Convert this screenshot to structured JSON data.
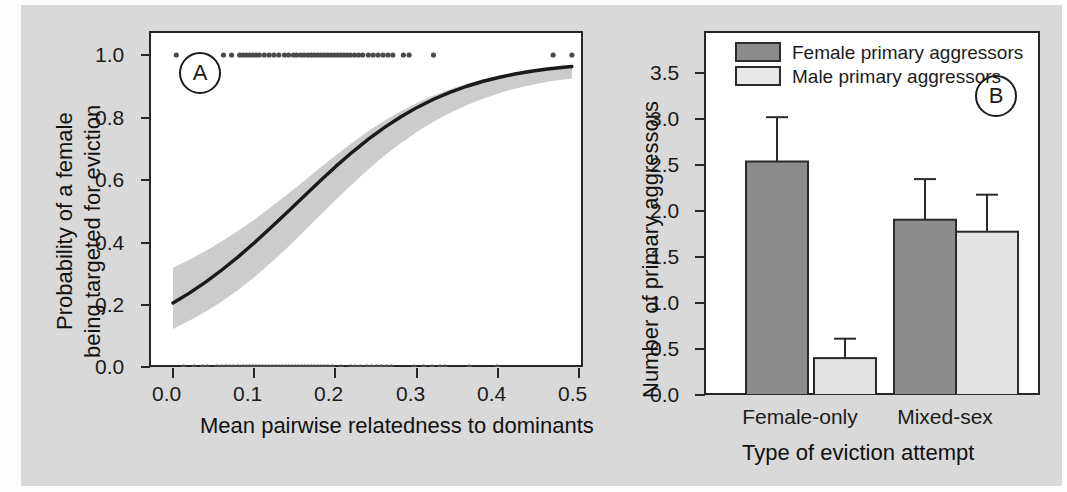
{
  "figure": {
    "background_color": "#d9d9d9",
    "panel_background": "#ffffff",
    "ink_color": "#262626"
  },
  "panels": [
    {
      "tag": "A",
      "chart_index": 0
    },
    {
      "tag": "B",
      "chart_index": 1
    }
  ],
  "chart_data": [
    {
      "type": "line",
      "panel": "A",
      "title": "",
      "xlabel": "Mean pairwise relatedness to dominants",
      "ylabel": "Probability of a female\nbeing targeted for eviction",
      "ylabel_line1": "Probability of a female",
      "ylabel_line2": "being targeted for eviction",
      "xlim": [
        -0.015,
        0.515
      ],
      "ylim": [
        -0.06,
        1.06
      ],
      "xticks": [
        0.0,
        0.1,
        0.2,
        0.3,
        0.4,
        0.5
      ],
      "xtick_labels": [
        "0.0",
        "0.1",
        "0.2",
        "0.3",
        "0.4",
        "0.5"
      ],
      "yticks": [
        0.0,
        0.2,
        0.4,
        0.6,
        0.8,
        1.0
      ],
      "ytick_labels": [
        "0.0",
        "0.2",
        "0.4",
        "0.6",
        "0.8",
        "1.0"
      ],
      "grid": false,
      "legend": null,
      "series": [
        {
          "name": "fitted logistic curve",
          "style": "solid-line",
          "color": "#1a1a1a",
          "linewidth": 3,
          "x": [
            0.0,
            0.02,
            0.04,
            0.06,
            0.08,
            0.1,
            0.12,
            0.14,
            0.16,
            0.18,
            0.2,
            0.22,
            0.24,
            0.26,
            0.28,
            0.3,
            0.32,
            0.34,
            0.36,
            0.38,
            0.4,
            0.42,
            0.44,
            0.46,
            0.48,
            0.49
          ],
          "y": [
            0.205,
            0.237,
            0.272,
            0.311,
            0.353,
            0.398,
            0.446,
            0.495,
            0.545,
            0.595,
            0.643,
            0.688,
            0.73,
            0.768,
            0.802,
            0.832,
            0.858,
            0.88,
            0.899,
            0.915,
            0.928,
            0.939,
            0.948,
            0.955,
            0.961,
            0.963
          ]
        },
        {
          "name": "95% confidence band",
          "style": "ribbon",
          "color": "#c9c9c9",
          "x": [
            0.0,
            0.02,
            0.04,
            0.06,
            0.08,
            0.1,
            0.12,
            0.14,
            0.16,
            0.18,
            0.2,
            0.22,
            0.24,
            0.26,
            0.28,
            0.3,
            0.32,
            0.34,
            0.36,
            0.38,
            0.4,
            0.42,
            0.44,
            0.46,
            0.48,
            0.49
          ],
          "y_upper": [
            0.318,
            0.344,
            0.372,
            0.403,
            0.437,
            0.473,
            0.512,
            0.553,
            0.594,
            0.637,
            0.679,
            0.719,
            0.756,
            0.79,
            0.82,
            0.847,
            0.87,
            0.89,
            0.907,
            0.921,
            0.933,
            0.943,
            0.951,
            0.958,
            0.963,
            0.966
          ],
          "y_lower": [
            0.122,
            0.148,
            0.177,
            0.21,
            0.247,
            0.288,
            0.333,
            0.381,
            0.432,
            0.484,
            0.536,
            0.586,
            0.634,
            0.678,
            0.718,
            0.754,
            0.786,
            0.814,
            0.838,
            0.859,
            0.877,
            0.892,
            0.904,
            0.914,
            0.921,
            0.924
          ]
        },
        {
          "name": "observations: targeted (y = 1)",
          "style": "points",
          "marker": "filled-circle",
          "y_value": 1.0,
          "x": [
            0.004,
            0.062,
            0.072,
            0.082,
            0.086,
            0.09,
            0.094,
            0.098,
            0.102,
            0.106,
            0.112,
            0.118,
            0.124,
            0.13,
            0.137,
            0.142,
            0.148,
            0.152,
            0.157,
            0.161,
            0.166,
            0.17,
            0.174,
            0.178,
            0.182,
            0.186,
            0.19,
            0.194,
            0.198,
            0.202,
            0.206,
            0.21,
            0.214,
            0.218,
            0.223,
            0.228,
            0.233,
            0.24,
            0.246,
            0.252,
            0.258,
            0.264,
            0.27,
            0.283,
            0.29,
            0.32,
            0.467,
            0.49
          ]
        },
        {
          "name": "observations: not targeted (y = 0)",
          "style": "points",
          "marker": "filled-circle",
          "y_value": 0.0,
          "x": [
            0.013,
            0.026,
            0.036,
            0.042,
            0.054,
            0.06,
            0.065,
            0.069,
            0.074,
            0.08,
            0.086,
            0.09,
            0.094,
            0.098,
            0.102,
            0.106,
            0.11,
            0.114,
            0.118,
            0.122,
            0.126,
            0.13,
            0.134,
            0.138,
            0.142,
            0.146,
            0.15,
            0.154,
            0.158,
            0.162,
            0.166,
            0.17,
            0.174,
            0.178,
            0.182,
            0.186,
            0.19,
            0.196,
            0.206,
            0.218,
            0.224,
            0.23,
            0.238,
            0.244,
            0.25,
            0.256,
            0.262,
            0.268,
            0.296,
            0.308,
            0.318,
            0.328,
            0.334,
            0.364,
            0.398
          ]
        }
      ]
    },
    {
      "type": "bar",
      "panel": "B",
      "title": "",
      "xlabel": "Type of eviction attempt",
      "ylabel": "Number of primary aggressors",
      "categories": [
        "Female-only",
        "Mixed-sex"
      ],
      "ylim": [
        0.0,
        3.75
      ],
      "yticks": [
        0.0,
        0.5,
        1.0,
        1.5,
        2.0,
        2.5,
        3.0,
        3.5
      ],
      "ytick_labels": [
        "0.0",
        "0.5",
        "1.0",
        "1.5",
        "2.0",
        "2.5",
        "3.0",
        "3.5"
      ],
      "grid": false,
      "legend_position": "top-left",
      "series": [
        {
          "name": "Female primary aggressors",
          "color": "#8c8c8c",
          "edge_color": "#2b2b2b",
          "values": [
            2.53,
            1.9
          ],
          "error_upper": [
            3.01,
            2.34
          ]
        },
        {
          "name": "Male primary aggressors",
          "color": "#e3e3e3",
          "edge_color": "#2b2b2b",
          "values": [
            0.4,
            1.77
          ],
          "error_upper": [
            0.61,
            2.17
          ]
        }
      ]
    }
  ],
  "panelA": {
    "tag": "A",
    "xlabel": "Mean pairwise relatedness to dominants",
    "ylabel_line1": "Probability of a female",
    "ylabel_line2": "being targeted for eviction",
    "xtick_labels": [
      "0.0",
      "0.1",
      "0.2",
      "0.3",
      "0.4",
      "0.5"
    ],
    "ytick_labels": [
      "1.0",
      "0.8",
      "0.6",
      "0.4",
      "0.2",
      "0.0"
    ]
  },
  "panelB": {
    "tag": "B",
    "xlabel": "Type of eviction attempt",
    "ylabel": "Number of primary aggressors",
    "ytick_labels": [
      "3.5",
      "3.0",
      "2.5",
      "2.0",
      "1.5",
      "1.0",
      "0.5",
      "0.0"
    ],
    "category_labels": [
      "Female-only",
      "Mixed-sex"
    ],
    "legend": [
      {
        "label": "Female primary aggressors",
        "swatch_color": "#8c8c8c"
      },
      {
        "label": "Male primary aggressors",
        "swatch_color": "#e3e3e3"
      }
    ]
  }
}
